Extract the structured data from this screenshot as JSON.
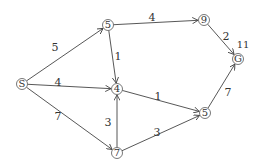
{
  "diagram": {
    "type": "weighted-directed-graph",
    "nodes": [
      {
        "id": "S",
        "label": "S"
      },
      {
        "id": "A",
        "label": "5"
      },
      {
        "id": "B",
        "label": "9"
      },
      {
        "id": "G",
        "label": "G",
        "annotation": "11"
      },
      {
        "id": "C",
        "label": "4"
      },
      {
        "id": "D",
        "label": "5"
      },
      {
        "id": "E",
        "label": "7"
      }
    ],
    "edges": [
      {
        "from": "S",
        "to": "A",
        "weight": "5"
      },
      {
        "from": "S",
        "to": "C",
        "weight": "4"
      },
      {
        "from": "S",
        "to": "E",
        "weight": "7"
      },
      {
        "from": "A",
        "to": "B",
        "weight": "4"
      },
      {
        "from": "A",
        "to": "C",
        "weight": "1"
      },
      {
        "from": "B",
        "to": "G",
        "weight": "2"
      },
      {
        "from": "C",
        "to": "D",
        "weight": "1"
      },
      {
        "from": "E",
        "to": "C",
        "weight": "3"
      },
      {
        "from": "E",
        "to": "D",
        "weight": "3"
      },
      {
        "from": "D",
        "to": "G",
        "weight": "7"
      }
    ]
  }
}
